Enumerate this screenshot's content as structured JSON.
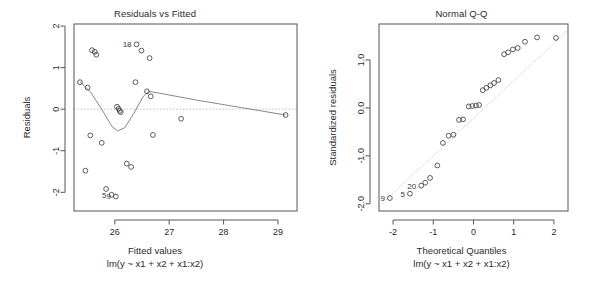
{
  "figure": {
    "kind": "r-regression-diagnostic-plots",
    "width": 613,
    "height": 290,
    "background": "#ffffff",
    "foreground": "#2b2b2b"
  },
  "panels": {
    "left": {
      "title": "Residuals vs Fitted",
      "xlabel": "Fitted values",
      "ylabel": "Residuals",
      "caption": "lm(y ~ x1 + x2 + x1:x2)",
      "x_ticks": [
        "26",
        "27",
        "28",
        "29"
      ],
      "y_ticks": [
        "-2",
        "-1",
        "0",
        "1",
        "2"
      ],
      "point_labels": [
        "18",
        "5",
        "9"
      ]
    },
    "right": {
      "title": "Normal Q-Q",
      "xlabel": "Theoretical Quantiles",
      "ylabel": "Standardized residuals",
      "caption": "lm(y ~ x1 + x2 + x1:x2)",
      "x_ticks": [
        "-2",
        "-1",
        "0",
        "1",
        "2"
      ],
      "y_ticks": [
        "-2.0",
        "-1.0",
        "0.0",
        "1.0"
      ],
      "point_labels": [
        "20",
        "5",
        "9"
      ]
    }
  },
  "chart_data": [
    {
      "type": "scatter",
      "id": "residuals-vs-fitted",
      "title": "Residuals vs Fitted",
      "xlabel": "Fitted values",
      "ylabel": "Residuals",
      "caption": "lm(y ~ x1 + x2 + x1:x2)",
      "xlim": [
        25.25,
        29.35
      ],
      "ylim": [
        -2.45,
        2.05
      ],
      "xticks": [
        26,
        27,
        28,
        29
      ],
      "yticks": [
        -2,
        -1,
        0,
        1,
        2
      ],
      "grid": false,
      "legend": "none",
      "marker": "open-circle",
      "reference_line": {
        "y": 0,
        "style": "dotted",
        "color": "#bdbdbd"
      },
      "points": [
        {
          "x": 25.36,
          "y": 0.65
        },
        {
          "x": 25.5,
          "y": 0.52
        },
        {
          "x": 25.58,
          "y": 1.42
        },
        {
          "x": 25.63,
          "y": 1.38
        },
        {
          "x": 25.66,
          "y": 1.31
        },
        {
          "x": 25.55,
          "y": -0.63
        },
        {
          "x": 25.46,
          "y": -1.48
        },
        {
          "x": 25.76,
          "y": -0.81
        },
        {
          "x": 25.84,
          "y": -1.92
        },
        {
          "x": 25.94,
          "y": -2.06
        },
        {
          "x": 26.02,
          "y": -2.1
        },
        {
          "x": 26.04,
          "y": 0.06
        },
        {
          "x": 26.07,
          "y": 0.01
        },
        {
          "x": 26.09,
          "y": -0.04
        },
        {
          "x": 26.11,
          "y": -0.07
        },
        {
          "x": 26.22,
          "y": -1.31
        },
        {
          "x": 26.3,
          "y": -1.39
        },
        {
          "x": 26.38,
          "y": 0.65
        },
        {
          "x": 26.4,
          "y": 1.56
        },
        {
          "x": 26.49,
          "y": 1.41
        },
        {
          "x": 26.59,
          "y": 0.43
        },
        {
          "x": 26.64,
          "y": 1.23
        },
        {
          "x": 26.66,
          "y": 0.31
        },
        {
          "x": 26.7,
          "y": -0.62
        },
        {
          "x": 27.22,
          "y": -0.23
        },
        {
          "x": 29.14,
          "y": -0.14
        }
      ],
      "labeled_points": [
        {
          "label": "18",
          "x": 26.4,
          "y": 1.56
        },
        {
          "label": "5",
          "x": 25.94,
          "y": -2.06
        },
        {
          "label": "9",
          "x": 26.02,
          "y": -2.1
        }
      ],
      "smoother": {
        "type": "loess",
        "color": "#7a7a7a",
        "points": [
          {
            "x": 25.36,
            "y": 0.66
          },
          {
            "x": 25.55,
            "y": 0.42
          },
          {
            "x": 25.75,
            "y": 0.02
          },
          {
            "x": 25.95,
            "y": -0.42
          },
          {
            "x": 26.05,
            "y": -0.52
          },
          {
            "x": 26.18,
            "y": -0.45
          },
          {
            "x": 26.35,
            "y": -0.1
          },
          {
            "x": 26.52,
            "y": 0.3
          },
          {
            "x": 26.62,
            "y": 0.43
          },
          {
            "x": 26.8,
            "y": 0.39
          },
          {
            "x": 27.5,
            "y": 0.22
          },
          {
            "x": 29.14,
            "y": -0.14
          }
        ]
      }
    },
    {
      "type": "scatter",
      "id": "normal-qq",
      "title": "Normal Q-Q",
      "xlabel": "Theoretical Quantiles",
      "ylabel": "Standardized residuals",
      "caption": "lm(y ~ x1 + x2 + x1:x2)",
      "xlim": [
        -2.35,
        2.35
      ],
      "ylim": [
        -2.15,
        1.75
      ],
      "xticks": [
        -2,
        -1,
        0,
        1,
        2
      ],
      "yticks": [
        -2.0,
        -1.0,
        0.0,
        1.0
      ],
      "grid": false,
      "legend": "none",
      "marker": "open-circle",
      "reference_line": {
        "type": "qq-line",
        "style": "dotted",
        "color": "#cccccc",
        "from": {
          "x": -2.35,
          "y": -2.05
        },
        "to": {
          "x": 2.35,
          "y": 1.62
        }
      },
      "points": [
        {
          "x": -2.08,
          "y": -1.88
        },
        {
          "x": -1.58,
          "y": -1.79
        },
        {
          "x": -1.3,
          "y": -1.62
        },
        {
          "x": -1.2,
          "y": -1.56
        },
        {
          "x": -1.08,
          "y": -1.46
        },
        {
          "x": -0.9,
          "y": -1.2
        },
        {
          "x": -0.76,
          "y": -0.73
        },
        {
          "x": -0.62,
          "y": -0.58
        },
        {
          "x": -0.5,
          "y": -0.56
        },
        {
          "x": -0.36,
          "y": -0.25
        },
        {
          "x": -0.26,
          "y": -0.24
        },
        {
          "x": -0.12,
          "y": 0.03
        },
        {
          "x": -0.03,
          "y": 0.04
        },
        {
          "x": 0.06,
          "y": 0.05
        },
        {
          "x": 0.14,
          "y": 0.06
        },
        {
          "x": 0.23,
          "y": 0.37
        },
        {
          "x": 0.32,
          "y": 0.42
        },
        {
          "x": 0.42,
          "y": 0.47
        },
        {
          "x": 0.51,
          "y": 0.52
        },
        {
          "x": 0.62,
          "y": 0.58
        },
        {
          "x": 0.76,
          "y": 1.12
        },
        {
          "x": 0.86,
          "y": 1.16
        },
        {
          "x": 0.98,
          "y": 1.22
        },
        {
          "x": 1.1,
          "y": 1.25
        },
        {
          "x": 1.28,
          "y": 1.38
        },
        {
          "x": 1.58,
          "y": 1.47
        },
        {
          "x": 2.05,
          "y": 1.46
        }
      ],
      "labeled_points": [
        {
          "label": "9",
          "x": -2.08,
          "y": -1.88
        },
        {
          "label": "5",
          "x": -1.58,
          "y": -1.79
        },
        {
          "label": "20",
          "x": -1.3,
          "y": -1.62
        }
      ]
    }
  ]
}
